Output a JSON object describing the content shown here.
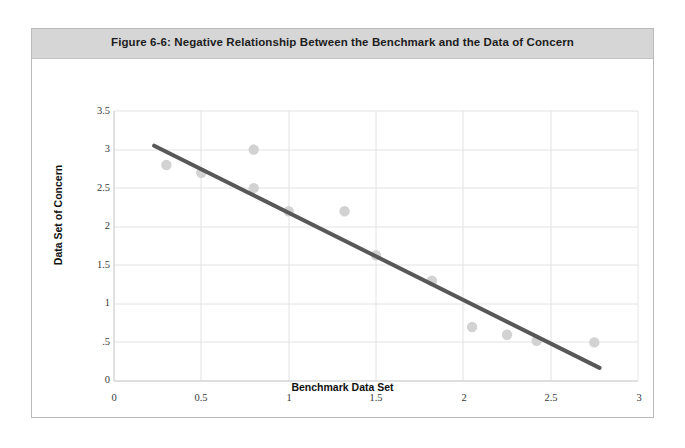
{
  "figure": {
    "title": "Figure 6-6: Negative Relationship Between the Benchmark and the Data of Concern"
  },
  "chart_data": {
    "type": "scatter",
    "title": "Figure 6-6: Negative Relationship Between the Benchmark and the Data of Concern",
    "xlabel": "Benchmark Data Set",
    "ylabel": "Data Set of Concern",
    "xlim": [
      0,
      3
    ],
    "ylim": [
      0,
      3.5
    ],
    "xticks": [
      0,
      0.5,
      1,
      1.5,
      2,
      2.5,
      3
    ],
    "xtick_labels": [
      "0",
      "0.5",
      "1",
      "1.5",
      "2",
      "2.5",
      "3"
    ],
    "yticks": [
      0,
      0.5,
      1,
      1.5,
      2,
      2.5,
      3,
      3.5
    ],
    "ytick_labels": [
      "0",
      ".5",
      "1",
      "1.5",
      "2",
      "2.5",
      "3",
      "3.5"
    ],
    "grid": "horizontal-and-vertical",
    "legend": "none",
    "point_color": "#d2d2d2",
    "trendline_color": "#585858",
    "axis_color": "#d9d9d9",
    "points": [
      {
        "x": 0.3,
        "y": 2.8
      },
      {
        "x": 0.5,
        "y": 2.7
      },
      {
        "x": 0.8,
        "y": 3.0
      },
      {
        "x": 0.8,
        "y": 2.5
      },
      {
        "x": 1.0,
        "y": 2.2
      },
      {
        "x": 1.32,
        "y": 2.2
      },
      {
        "x": 1.5,
        "y": 1.63
      },
      {
        "x": 1.82,
        "y": 1.3
      },
      {
        "x": 2.05,
        "y": 0.7
      },
      {
        "x": 2.25,
        "y": 0.6
      },
      {
        "x": 2.42,
        "y": 0.52
      },
      {
        "x": 2.75,
        "y": 0.5
      }
    ],
    "trendline": {
      "x0": 0.23,
      "y0": 3.05,
      "x1": 2.78,
      "y1": 0.17
    }
  }
}
